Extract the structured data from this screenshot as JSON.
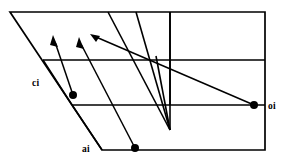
{
  "figure": {
    "canvas": {
      "width": 289,
      "height": 165,
      "background": "#ffffff"
    },
    "stroke_color": "#000000",
    "labels": {
      "ci": "ci",
      "ai": "ai",
      "oi": "oi"
    },
    "label_positions": {
      "ci": {
        "x": 32,
        "y": 86
      },
      "ai": {
        "x": 82,
        "y": 152
      },
      "oi": {
        "x": 268,
        "y": 109
      }
    },
    "outline": {
      "name": "slanted-quadrilateral",
      "points": "10,12 265,12 265,150 102,150"
    },
    "grid_lines": [
      {
        "name": "horizontal-upper",
        "x1": 43,
        "y1": 60,
        "x2": 265,
        "y2": 60
      },
      {
        "name": "horizontal-lower",
        "x1": 72,
        "y1": 105,
        "x2": 265,
        "y2": 105
      },
      {
        "name": "vertical-middle",
        "x1": 170,
        "y1": 12,
        "x2": 170,
        "y2": 105
      }
    ],
    "ray_lines": [
      {
        "name": "ray-left-edge",
        "x1": 108,
        "y1": 12,
        "x2": 170,
        "y2": 130
      },
      {
        "name": "ray-right-edge",
        "x1": 136,
        "y1": 12,
        "x2": 170,
        "y2": 130
      },
      {
        "name": "ray-vertical-drop",
        "x1": 170,
        "y1": 12,
        "x2": 170,
        "y2": 130
      },
      {
        "name": "ray-diagonal-long",
        "x1": 158,
        "y1": 60,
        "x2": 170,
        "y2": 130
      }
    ],
    "vectors": [
      {
        "name": "vector-ci-to-upper",
        "tail": {
          "x": 73,
          "y": 95
        },
        "tip": {
          "x": 53,
          "y": 38
        },
        "dot": true,
        "arrow": true
      },
      {
        "name": "vector-ai-to-upper",
        "tail": {
          "x": 135,
          "y": 148
        },
        "tip": {
          "x": 79,
          "y": 40
        },
        "dot": true,
        "arrow": true
      },
      {
        "name": "vector-oi-to-upper",
        "tail": {
          "x": 254,
          "y": 105
        },
        "tip": {
          "x": 92,
          "y": 35
        },
        "dot": true,
        "arrow": true
      }
    ],
    "dots": [
      {
        "name": "dot-ci",
        "x": 73,
        "y": 95,
        "r": 4.0
      },
      {
        "name": "dot-ai",
        "x": 135,
        "y": 148,
        "r": 4.0
      },
      {
        "name": "dot-oi",
        "x": 254,
        "y": 105,
        "r": 4.0
      }
    ]
  }
}
